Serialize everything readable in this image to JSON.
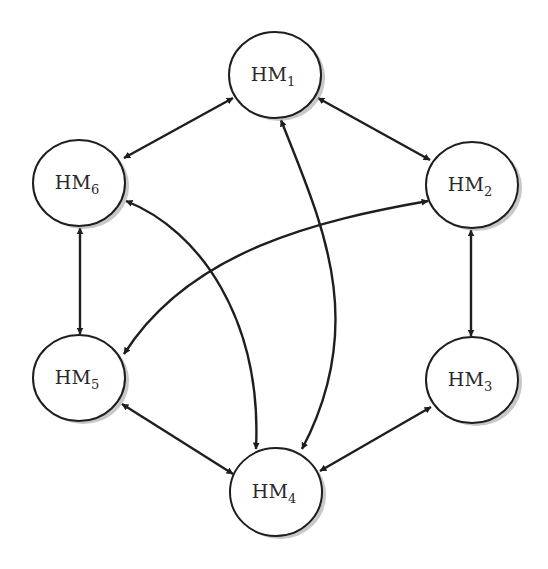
{
  "diagram": {
    "type": "network",
    "nodes": [
      {
        "id": "HM1",
        "base": "HM",
        "sub": "1",
        "cx": 275,
        "cy": 75
      },
      {
        "id": "HM2",
        "base": "HM",
        "sub": "2",
        "cx": 472,
        "cy": 185
      },
      {
        "id": "HM3",
        "base": "HM",
        "sub": "3",
        "cx": 472,
        "cy": 380
      },
      {
        "id": "HM4",
        "base": "HM",
        "sub": "4",
        "cx": 276,
        "cy": 492
      },
      {
        "id": "HM5",
        "base": "HM",
        "sub": "5",
        "cx": 79,
        "cy": 378
      },
      {
        "id": "HM6",
        "base": "HM",
        "sub": "6",
        "cx": 79,
        "cy": 183
      }
    ],
    "edges": [
      {
        "from": "HM1",
        "to": "HM6",
        "direction": "bidirectional",
        "shape": "straight"
      },
      {
        "from": "HM1",
        "to": "HM2",
        "direction": "bidirectional",
        "shape": "straight"
      },
      {
        "from": "HM6",
        "to": "HM5",
        "direction": "bidirectional",
        "shape": "straight"
      },
      {
        "from": "HM2",
        "to": "HM3",
        "direction": "bidirectional",
        "shape": "straight"
      },
      {
        "from": "HM5",
        "to": "HM4",
        "direction": "bidirectional",
        "shape": "straight"
      },
      {
        "from": "HM3",
        "to": "HM4",
        "direction": "bidirectional",
        "shape": "straight"
      },
      {
        "from": "HM6",
        "to": "HM4",
        "direction": "bidirectional",
        "shape": "curved"
      },
      {
        "from": "HM2",
        "to": "HM5",
        "direction": "bidirectional",
        "shape": "curved"
      },
      {
        "from": "HM1",
        "to": "HM4",
        "direction": "bidirectional",
        "shape": "curved"
      }
    ],
    "colors": {
      "stroke": "#1e1e1e",
      "fill": "#ffffff",
      "shadow": "#9a9a9a"
    }
  }
}
